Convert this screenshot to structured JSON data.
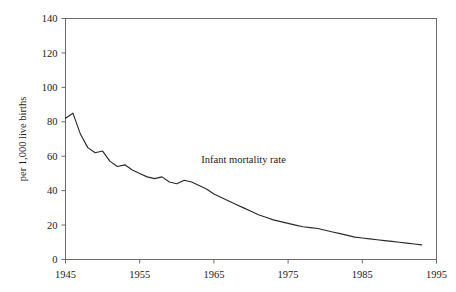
{
  "chart_data": {
    "type": "line",
    "title": "",
    "subtitle": "",
    "xlabel": "",
    "ylabel": "per 1,000 live births",
    "xlim": [
      1945,
      1995
    ],
    "ylim": [
      0,
      140
    ],
    "grid": false,
    "legend": "none",
    "annotations": [
      {
        "text": "Infant mortality rate",
        "x": 1969,
        "y": 56
      }
    ],
    "xticks": [
      1945,
      1955,
      1965,
      1975,
      1985,
      1995
    ],
    "xtick_labels": [
      "1945",
      "1955",
      "1965",
      "1975",
      "1985",
      "1995"
    ],
    "yticks": [
      0,
      20,
      40,
      60,
      80,
      100,
      120,
      140
    ],
    "ytick_labels": [
      "0",
      "20",
      "40",
      "60",
      "80",
      "100",
      "120",
      "140"
    ],
    "series": [
      {
        "name": "Infant mortality rate",
        "color": "#2a2a2a",
        "x": [
          1945,
          1946,
          1947,
          1948,
          1949,
          1950,
          1951,
          1952,
          1953,
          1954,
          1955,
          1956,
          1957,
          1958,
          1959,
          1960,
          1961,
          1962,
          1963,
          1964,
          1965,
          1966,
          1967,
          1968,
          1969,
          1970,
          1971,
          1972,
          1973,
          1974,
          1975,
          1976,
          1977,
          1978,
          1979,
          1980,
          1981,
          1982,
          1983,
          1984,
          1985,
          1986,
          1987,
          1988,
          1989,
          1990,
          1991,
          1992,
          1993
        ],
        "values": [
          82.0,
          85.0,
          73.0,
          65.0,
          62.0,
          63.0,
          57.0,
          54.0,
          55.0,
          52.0,
          50.0,
          48.0,
          47.0,
          48.0,
          45.0,
          44.0,
          46.0,
          45.0,
          43.0,
          41.0,
          38.0,
          36.0,
          34.0,
          32.0,
          30.0,
          28.0,
          26.0,
          24.5,
          23.0,
          22.0,
          21.0,
          20.0,
          19.0,
          18.5,
          18.0,
          17.0,
          16.0,
          15.0,
          14.0,
          13.0,
          12.5,
          12.0,
          11.5,
          11.0,
          10.5,
          10.0,
          9.5,
          9.0,
          8.5
        ]
      }
    ]
  },
  "axis": {
    "ylabel": "per 1,000 live births"
  }
}
